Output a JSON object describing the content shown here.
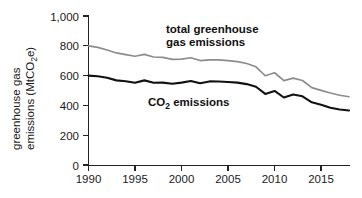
{
  "chart_data": {
    "type": "line",
    "title": "",
    "xlabel": "",
    "ylabel": "greenhouse gas emissions (MtCO2e)",
    "ylabel_main": "greenhouse gas",
    "ylabel_sub_pre": "emissions (MtCO",
    "ylabel_sub_num": "2",
    "ylabel_sub_post": "e)",
    "xlim": [
      1990,
      2018
    ],
    "ylim": [
      0,
      1000
    ],
    "grid": false,
    "legend_position": "inline-annotations",
    "y_ticks": [
      0,
      200,
      400,
      600,
      800,
      1000
    ],
    "y_tick_labels": [
      "0",
      "200",
      "400",
      "600",
      "800",
      "1,000"
    ],
    "x_ticks": [
      1990,
      1995,
      2000,
      2005,
      2010,
      2015
    ],
    "x_tick_labels": [
      "1990",
      "1995",
      "2000",
      "2005",
      "2010",
      "2015"
    ],
    "x": [
      1990,
      1991,
      1992,
      1993,
      1994,
      1995,
      1996,
      1997,
      1998,
      1999,
      2000,
      2001,
      2002,
      2003,
      2004,
      2005,
      2006,
      2007,
      2008,
      2009,
      2010,
      2011,
      2012,
      2013,
      2014,
      2015,
      2016,
      2017,
      2018
    ],
    "series": [
      {
        "name": "total greenhouse gas emissions",
        "color": "#8c8c8c",
        "label_line1": "total greenhouse",
        "label_line2": "gas emissions",
        "values": [
          800,
          789,
          772,
          752,
          741,
          730,
          742,
          725,
          722,
          709,
          711,
          720,
          701,
          706,
          705,
          700,
          694,
          681,
          659,
          599,
          619,
          566,
          583,
          567,
          519,
          501,
          483,
          468,
          458
        ]
      },
      {
        "name": "CO2 emissions",
        "color": "#111111",
        "label_pre": "CO",
        "label_sub": "2",
        "label_post": " emissions",
        "values": [
          600,
          596,
          586,
          568,
          562,
          552,
          568,
          552,
          553,
          545,
          553,
          564,
          549,
          561,
          560,
          557,
          553,
          543,
          525,
          477,
          497,
          453,
          473,
          461,
          421,
          405,
          384,
          373,
          366
        ]
      }
    ]
  }
}
